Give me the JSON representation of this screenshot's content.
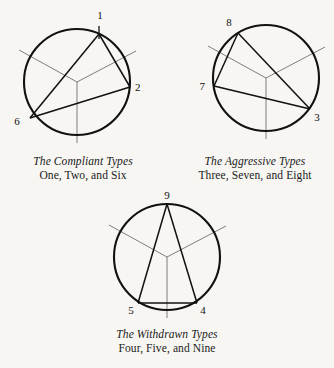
{
  "figure": {
    "name": "enneagram-hornevian-triads",
    "background_color": "#f7f6f2",
    "ink_color": "#111111",
    "inner_line_color": "#6f6f6f"
  },
  "groups": [
    {
      "id": "compliant",
      "title": "The Compliant Types",
      "subtitle": "One, Two, and Six",
      "circle": {
        "cx": 77,
        "cy": 82,
        "r": 53
      },
      "points": [
        {
          "label": "1",
          "angle_deg": -65,
          "text_x": 100,
          "text_y": 19
        },
        {
          "label": "2",
          "angle_deg": 5,
          "text_x": 135,
          "text_y": 91
        },
        {
          "label": "6",
          "angle_deg": 215,
          "text_x": 17,
          "text_y": 125
        }
      ],
      "triangle": "1-2-6"
    },
    {
      "id": "aggressive",
      "title": "The Aggressive Types",
      "subtitle": "Three, Seven, and Eight",
      "circle": {
        "cx": 266,
        "cy": 78,
        "r": 53
      },
      "points": [
        {
          "label": "8",
          "angle_deg": -122,
          "text_x": 229,
          "text_y": 26
        },
        {
          "label": "7",
          "angle_deg": 188,
          "text_x": 205,
          "text_y": 90
        },
        {
          "label": "3",
          "angle_deg": 35,
          "text_x": 317,
          "text_y": 121
        }
      ],
      "triangle": "8-7-3"
    },
    {
      "id": "withdrawn",
      "title": "The Withdrawn Types",
      "subtitle": "Four, Five, and Nine",
      "circle": {
        "cx": 167,
        "cy": 257,
        "r": 53
      },
      "points": [
        {
          "label": "9",
          "angle_deg": -90,
          "text_x": 167,
          "text_y": 198
        },
        {
          "label": "5",
          "angle_deg": 125,
          "text_x": 131,
          "text_y": 312
        },
        {
          "label": "4",
          "angle_deg": 55,
          "text_x": 203,
          "text_y": 312
        }
      ],
      "triangle": "9-5-4"
    }
  ],
  "spokes": {
    "description": "three gray radii from each circle centre toward 12, 4 and 8 o'clock positions extending slightly past the rim as tick marks",
    "angles_deg": [
      90,
      210,
      330
    ]
  }
}
